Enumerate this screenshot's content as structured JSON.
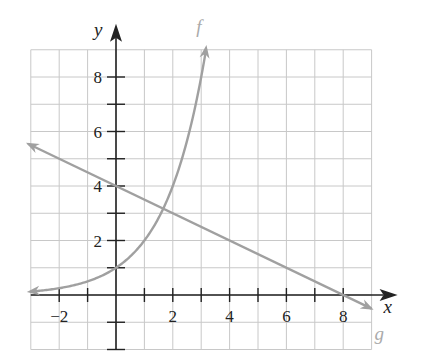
{
  "chart_data": {
    "type": "line",
    "title": "",
    "xlabel": "x",
    "ylabel": "y",
    "xlim": [
      -3,
      9
    ],
    "ylim": [
      -2,
      9
    ],
    "grid": true,
    "x_ticks": [
      -2,
      -1,
      0,
      1,
      2,
      3,
      4,
      5,
      6,
      7,
      8
    ],
    "x_tick_labels": [
      {
        "value": -2,
        "label": "−2"
      },
      {
        "value": 2,
        "label": "2"
      },
      {
        "value": 4,
        "label": "4"
      },
      {
        "value": 6,
        "label": "6"
      },
      {
        "value": 8,
        "label": "8"
      }
    ],
    "y_tick_labels": [
      {
        "value": 2,
        "label": "2"
      },
      {
        "value": 4,
        "label": "4"
      },
      {
        "value": 6,
        "label": "6"
      },
      {
        "value": 8,
        "label": "8"
      }
    ],
    "series": [
      {
        "name": "f",
        "label": "f",
        "formula": "2^x",
        "x_range": [
          -3,
          3.17
        ],
        "color": "#a0a0a0"
      },
      {
        "name": "g",
        "label": "g",
        "formula": "4 - x/2",
        "x_range": [
          -3,
          9
        ],
        "color": "#a0a0a0"
      }
    ]
  }
}
